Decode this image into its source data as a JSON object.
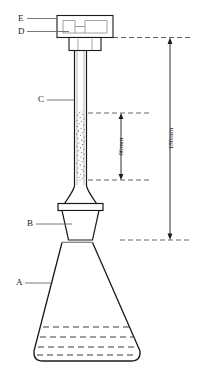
{
  "diagram": {
    "stroke_color": "#1a1a1a",
    "fill_color": "#ffffff",
    "dash_color": "#555555",
    "part_labels": [
      {
        "id": "A",
        "text": "A",
        "meaning": "conical-flask"
      },
      {
        "id": "B",
        "text": "B",
        "meaning": "rubber-stopper"
      },
      {
        "id": "C",
        "text": "C",
        "meaning": "packed-tube"
      },
      {
        "id": "D",
        "text": "D",
        "meaning": "tube-collar"
      },
      {
        "id": "E",
        "text": "E",
        "meaning": "cap-head"
      }
    ],
    "dimensions": [
      {
        "id": "inner",
        "text": "80mm",
        "value": 80,
        "unit": "mm"
      },
      {
        "id": "outer",
        "text": "180mm",
        "value": 180,
        "unit": "mm"
      }
    ]
  }
}
